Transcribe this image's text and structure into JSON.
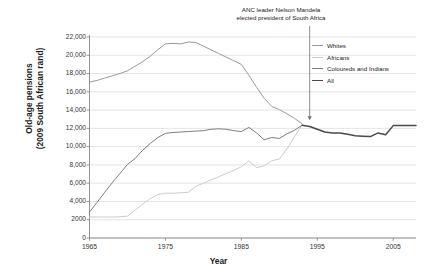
{
  "chart_data": {
    "type": "line",
    "title": "",
    "xlabel": "Year",
    "ylabel": "Old-age pensions\n(2009 South African rand)",
    "xlim": [
      1965,
      2008
    ],
    "ylim": [
      0,
      22000
    ],
    "grid": true,
    "legend_position": "right",
    "xticks": [
      "1965",
      "1975",
      "1985",
      "1995",
      "2005"
    ],
    "xtick_values": [
      1965,
      1975,
      1985,
      1995,
      2005
    ],
    "yticks": [
      "0",
      "2000",
      "4,000",
      "6,000",
      "8,000",
      "10,000",
      "12,000",
      "14,000",
      "16,000",
      "18,000",
      "20,000",
      "22,000"
    ],
    "ytick_values": [
      0,
      2000,
      4000,
      6000,
      8000,
      10000,
      12000,
      14000,
      16000,
      18000,
      20000,
      22000
    ],
    "annotations": [
      {
        "text": "ANC leader Nelson Mandela\nelected president of South Africa",
        "x": 1994,
        "y": 12900,
        "arrow": true
      }
    ],
    "series": [
      {
        "name": "Whites",
        "color": "#9a9a9a",
        "x": [
          1965,
          1966,
          1967,
          1968,
          1969,
          1970,
          1971,
          1972,
          1973,
          1974,
          1975,
          1976,
          1977,
          1978,
          1979,
          1980,
          1981,
          1982,
          1983,
          1984,
          1985,
          1986,
          1987,
          1988,
          1989,
          1990,
          1991,
          1992,
          1993
        ],
        "values": [
          17050,
          17250,
          17500,
          17750,
          18000,
          18300,
          18800,
          19300,
          19900,
          20600,
          21250,
          21300,
          21250,
          21450,
          21400,
          21000,
          20600,
          20200,
          19800,
          19400,
          19000,
          17800,
          16500,
          15300,
          14400,
          14050,
          13600,
          13100,
          12500
        ]
      },
      {
        "name": "Africans",
        "color": "#cccccc",
        "x": [
          1965,
          1966,
          1967,
          1968,
          1969,
          1970,
          1971,
          1972,
          1973,
          1974,
          1975,
          1976,
          1977,
          1978,
          1979,
          1980,
          1981,
          1982,
          1983,
          1984,
          1985,
          1986,
          1987,
          1988,
          1989,
          1990,
          1991,
          1992,
          1993
        ],
        "values": [
          2300,
          2300,
          2300,
          2300,
          2320,
          2400,
          3050,
          3700,
          4300,
          4750,
          4900,
          4900,
          4950,
          5000,
          5650,
          6000,
          6350,
          6700,
          7050,
          7400,
          7800,
          8450,
          7700,
          7900,
          8450,
          8650,
          9750,
          11100,
          12350
        ]
      },
      {
        "name": "Coloureds and Indians",
        "color": "#7d7d7d",
        "x": [
          1965,
          1966,
          1967,
          1968,
          1969,
          1970,
          1971,
          1972,
          1973,
          1974,
          1975,
          1976,
          1977,
          1978,
          1979,
          1980,
          1981,
          1982,
          1983,
          1984,
          1985,
          1986,
          1987,
          1988,
          1989,
          1990,
          1991,
          1992,
          1993
        ],
        "values": [
          2850,
          3900,
          5000,
          6050,
          7050,
          8050,
          8700,
          9600,
          10350,
          11000,
          11450,
          11550,
          11600,
          11650,
          11700,
          11750,
          11900,
          11950,
          11900,
          11750,
          11650,
          12100,
          11500,
          10750,
          11000,
          10900,
          11400,
          11800,
          12350
        ]
      },
      {
        "name": "All",
        "color": "#4a4a4a",
        "x": [
          1993,
          1994,
          1995,
          1996,
          1997,
          1998,
          1999,
          2000,
          2001,
          2002,
          2003,
          2004,
          2005,
          2006,
          2007,
          2008
        ],
        "values": [
          12350,
          12200,
          11900,
          11600,
          11500,
          11500,
          11350,
          11200,
          11150,
          11100,
          11500,
          11300,
          12300,
          12300,
          12300,
          12300
        ]
      }
    ]
  },
  "legend": {
    "items": [
      {
        "label": "Whites",
        "color": "#9a9a9a"
      },
      {
        "label": "Africans",
        "color": "#cccccc"
      },
      {
        "label": "Coloureds and Indians",
        "color": "#7d7d7d"
      },
      {
        "label": "All",
        "color": "#4a4a4a"
      }
    ]
  },
  "annotation": {
    "line1": "ANC leader Nelson Mandela",
    "line2": "elected president of South Africa",
    "full": "ANC leader Nelson Mandela\nelected president of South Africa"
  },
  "axes": {
    "x_title": "Year",
    "y_title": "Old-age pensions\n(2009 South African rand)"
  },
  "colors": {
    "whites": "#9a9a9a",
    "africans": "#cccccc",
    "coloureds_indians": "#7d7d7d",
    "all": "#4a4a4a",
    "grid": "#d8d8d8",
    "axis": "#888888",
    "text": "#222222"
  }
}
